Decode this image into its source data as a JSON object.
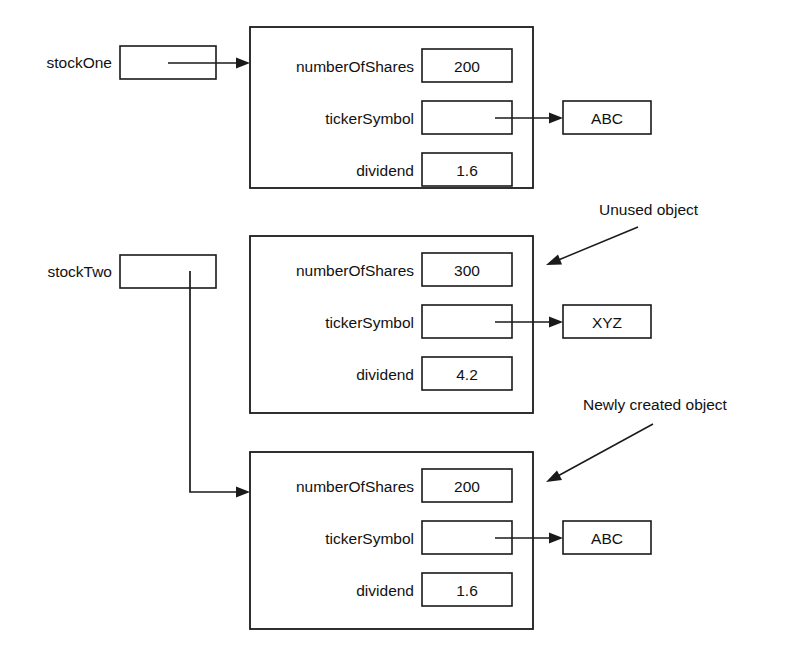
{
  "diagram": {
    "stroke_color": "#1a1a1a",
    "background_color": "#ffffff",
    "variables": [
      {
        "id": "stockOne",
        "label": "stockOne",
        "value": "",
        "points_to": "object-one"
      },
      {
        "id": "stockTwo",
        "label": "stockTwo",
        "value": "",
        "points_to": "object-three"
      }
    ],
    "objects": [
      {
        "id": "object-one",
        "annotation": "",
        "fields": [
          {
            "name": "numberOfShares",
            "value": "200",
            "is_reference": false
          },
          {
            "name": "tickerSymbol",
            "value": "",
            "is_reference": true,
            "target": "ABC"
          },
          {
            "name": "dividend",
            "value": "1.6",
            "is_reference": false
          }
        ]
      },
      {
        "id": "object-two",
        "annotation": "Unused object",
        "fields": [
          {
            "name": "numberOfShares",
            "value": "300",
            "is_reference": false
          },
          {
            "name": "tickerSymbol",
            "value": "",
            "is_reference": true,
            "target": "XYZ"
          },
          {
            "name": "dividend",
            "value": "4.2",
            "is_reference": false
          }
        ]
      },
      {
        "id": "object-three",
        "annotation": "Newly created object",
        "fields": [
          {
            "name": "numberOfShares",
            "value": "200",
            "is_reference": false
          },
          {
            "name": "tickerSymbol",
            "value": "",
            "is_reference": true,
            "target": "ABC"
          },
          {
            "name": "dividend",
            "value": "1.6",
            "is_reference": false
          }
        ]
      }
    ],
    "string_nodes": [
      {
        "id": "string-abc-top",
        "value": "ABC"
      },
      {
        "id": "string-xyz",
        "value": "XYZ"
      },
      {
        "id": "string-abc-bottom",
        "value": "ABC"
      }
    ],
    "annotations": [
      {
        "id": "annotation-unused",
        "text": "Unused object"
      },
      {
        "id": "annotation-new",
        "text": "Newly created object"
      }
    ]
  }
}
